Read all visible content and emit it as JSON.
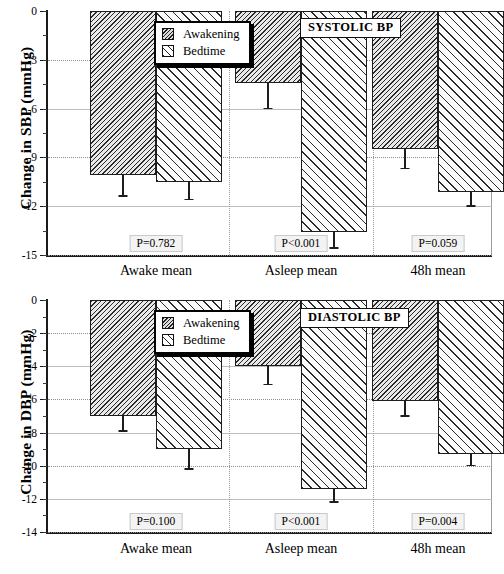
{
  "figure": {
    "panels": [
      {
        "id": "sbp",
        "tag": "SYSTOLIC BP",
        "ylabel": "Change in SBP (mmHg)",
        "legend": {
          "items": [
            "Awakening",
            "Bedtime"
          ]
        },
        "yticks": [
          "0",
          "-3",
          "-6",
          "-9",
          "-12",
          "-15"
        ],
        "categories": [
          "Awake mean",
          "Asleep mean",
          "48h mean"
        ],
        "pvalues": [
          "P=0.782",
          "P<0.001",
          "P=0.059"
        ]
      },
      {
        "id": "dbp",
        "tag": "DIASTOLIC BP",
        "ylabel": "Change in DBP (mmHg)",
        "legend": {
          "items": [
            "Awakening",
            "Bedtime"
          ]
        },
        "yticks": [
          "0",
          "-2",
          "-4",
          "-6",
          "-8",
          "-10",
          "-12",
          "-14"
        ],
        "categories": [
          "Awake mean",
          "Asleep mean",
          "48h mean"
        ],
        "pvalues": [
          "P=0.100",
          "P<0.001",
          "P=0.004"
        ]
      }
    ]
  },
  "chart_data": [
    {
      "type": "bar",
      "title": "SYSTOLIC BP",
      "xlabel": "",
      "ylabel": "Change in SBP (mmHg)",
      "ylim": [
        -15,
        0
      ],
      "yticks": [
        0,
        -3,
        -6,
        -9,
        -12,
        -15
      ],
      "grid": true,
      "legend_position": "top-center",
      "categories": [
        "Awake mean",
        "Asleep mean",
        "48h mean"
      ],
      "series": [
        {
          "name": "Awakening",
          "values": [
            -10.1,
            -4.4,
            -8.5
          ],
          "errors": [
            1.3,
            1.6,
            1.2
          ]
        },
        {
          "name": "Bedtime",
          "values": [
            -10.5,
            -13.6,
            -11.1
          ],
          "errors": [
            1.1,
            1.0,
            0.9
          ]
        }
      ],
      "annotations": [
        {
          "category": "Awake mean",
          "text": "P=0.782"
        },
        {
          "category": "Asleep mean",
          "text": "P<0.001"
        },
        {
          "category": "48h mean",
          "text": "P=0.059"
        }
      ]
    },
    {
      "type": "bar",
      "title": "DIASTOLIC BP",
      "xlabel": "",
      "ylabel": "Change in DBP (mmHg)",
      "ylim": [
        -14,
        0
      ],
      "yticks": [
        0,
        -2,
        -4,
        -6,
        -8,
        -10,
        -12,
        -14
      ],
      "grid": true,
      "legend_position": "top-center",
      "categories": [
        "Awake mean",
        "Asleep mean",
        "48h mean"
      ],
      "series": [
        {
          "name": "Awakening",
          "values": [
            -7.0,
            -4.0,
            -6.1
          ],
          "errors": [
            0.9,
            1.1,
            0.9
          ]
        },
        {
          "name": "Bedtime",
          "values": [
            -9.0,
            -11.4,
            -9.3
          ],
          "errors": [
            1.2,
            0.8,
            0.7
          ]
        }
      ],
      "annotations": [
        {
          "category": "Awake mean",
          "text": "P=0.100"
        },
        {
          "category": "Asleep mean",
          "text": "P<0.001"
        },
        {
          "category": "48h mean",
          "text": "P=0.004"
        }
      ]
    }
  ]
}
